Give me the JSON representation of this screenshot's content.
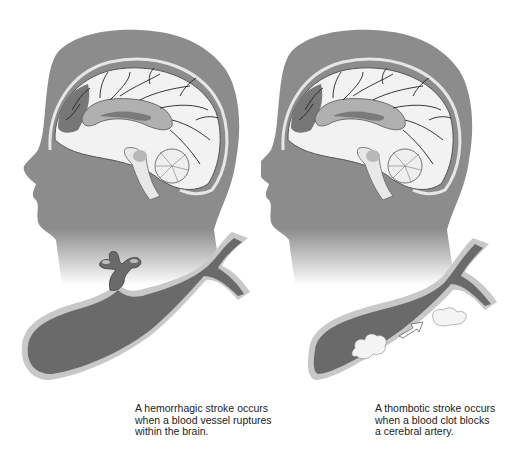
{
  "figure": {
    "colors": {
      "head": "#8c8c8c",
      "brain_light": "#f2f2f2",
      "brain_mid": "#b0b0b0",
      "brain_dark": "#6e6e6e",
      "vessel_fill": "#6a6a6a",
      "vessel_wall": "#c8c8c8",
      "clot": "#f4f4f4",
      "background": "#ffffff"
    },
    "panels": [
      {
        "id": "hemorrhagic",
        "illustration": "head-profile-with-brain-and-ruptured-vessel",
        "caption_lines": [
          "A hemorrhagic stroke occurs",
          "when a blood vessel ruptures",
          "within the brain."
        ]
      },
      {
        "id": "thrombotic",
        "illustration": "head-profile-with-brain-and-blocked-vessel",
        "caption_lines": [
          "A thombotic stroke occurs",
          "when a blood clot blocks",
          "a cerebral artery."
        ]
      }
    ]
  }
}
